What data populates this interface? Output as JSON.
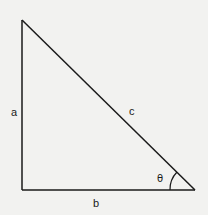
{
  "diagram": {
    "type": "right-triangle",
    "vertices": {
      "top": [
        22,
        20
      ],
      "right_angle": [
        22,
        190
      ],
      "bottom_right": [
        195,
        190
      ]
    },
    "labels": {
      "side_vertical": "a",
      "side_horizontal": "b",
      "hypotenuse": "c",
      "angle": "θ"
    },
    "colors": {
      "background": "#f2f2f0",
      "stroke": "#1a1a1a"
    }
  }
}
